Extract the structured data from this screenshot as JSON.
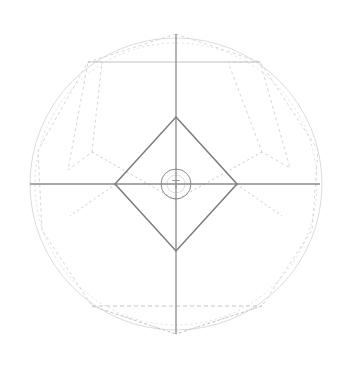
{
  "diagram": {
    "title": "Geometric construction drawing",
    "center": {
      "x": 176,
      "y": 184
    },
    "colors": {
      "background": "#ffffff",
      "axis": "#8a8a8a",
      "diamond": "#7a7a7a",
      "construction": "#d6d6d6",
      "construction_dark": "#c4c4c4",
      "outer_circle": "#dcdcdc"
    },
    "outer_circle": {
      "cx": 176,
      "cy": 184,
      "r": 146
    },
    "inner_circle": {
      "cx": 176,
      "cy": 184,
      "r": 15
    },
    "center_glyph": "T",
    "axes": {
      "vertical": {
        "x": 176,
        "y1": 34,
        "y2": 334
      },
      "horizontal": {
        "y": 184,
        "x1": 30,
        "x2": 320
      }
    },
    "diamond": {
      "points": [
        [
          176,
          117
        ],
        [
          237,
          184
        ],
        [
          176,
          251
        ],
        [
          115,
          184
        ]
      ]
    },
    "top_chord": {
      "y": 62,
      "x1": 88,
      "x2": 260
    },
    "bottom_chord": {
      "y": 306,
      "x1": 92,
      "x2": 262
    },
    "construction_polygons": [
      {
        "name": "upper-left-panel",
        "points": [
          [
            88,
            62
          ],
          [
            102,
            62
          ],
          [
            92,
            152
          ],
          [
            68,
            170
          ]
        ]
      },
      {
        "name": "upper-right-panel",
        "points": [
          [
            260,
            62
          ],
          [
            228,
            62
          ],
          [
            262,
            152
          ],
          [
            290,
            168
          ]
        ]
      },
      {
        "name": "outer-octagon",
        "points": [
          [
            176,
            34
          ],
          [
            88,
            62
          ],
          [
            38,
            150
          ],
          [
            42,
            230
          ],
          [
            92,
            306
          ],
          [
            176,
            334
          ],
          [
            262,
            306
          ],
          [
            312,
            230
          ],
          [
            318,
            150
          ],
          [
            260,
            62
          ]
        ]
      }
    ],
    "diagonal_hints": [
      [
        [
          92,
          152
        ],
        [
          176,
          200
        ]
      ],
      [
        [
          262,
          152
        ],
        [
          176,
          200
        ]
      ],
      [
        [
          92,
          306
        ],
        [
          176,
          334
        ]
      ],
      [
        [
          262,
          306
        ],
        [
          176,
          334
        ]
      ],
      [
        [
          116,
          184
        ],
        [
          70,
          216
        ]
      ],
      [
        [
          236,
          184
        ],
        [
          282,
          216
        ]
      ]
    ]
  }
}
